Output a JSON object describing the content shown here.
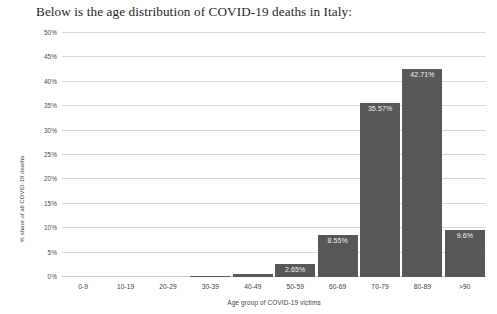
{
  "heading": "Below is the age distribution of COVID-19 deaths in Italy:",
  "chart_data": {
    "type": "bar",
    "title": "",
    "xlabel": "Age group of COVID-19 victims",
    "ylabel": "% share of all COVID-19 deaths",
    "categories": [
      "0-9",
      "10-19",
      "20-29",
      "30-39",
      "40-49",
      "50-59",
      "60-69",
      "70-79",
      "80-89",
      ">90"
    ],
    "values": [
      0,
      0,
      0,
      0.19,
      0.52,
      2.65,
      8.55,
      35.57,
      42.71,
      9.6
    ],
    "value_labels": [
      "",
      "",
      "",
      "",
      "",
      "2.65%",
      "8.55%",
      "35.57%",
      "42.71%",
      "9.6%"
    ],
    "ylim": [
      0,
      50
    ],
    "yticks": [
      0,
      5,
      10,
      15,
      20,
      25,
      30,
      35,
      40,
      45,
      50
    ],
    "ytick_labels": [
      "0%",
      "5%",
      "10%",
      "15%",
      "20%",
      "25%",
      "30%",
      "35%",
      "40%",
      "45%",
      "50%"
    ],
    "grid": true,
    "legend": false,
    "bar_color": "#585858"
  }
}
